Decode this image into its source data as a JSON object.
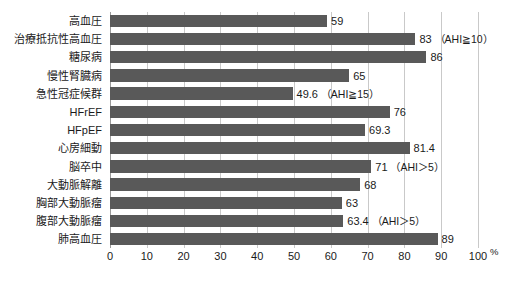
{
  "chart_data": {
    "type": "bar",
    "orientation": "horizontal",
    "title": "",
    "xlabel": "%",
    "ylabel": "",
    "xlim": [
      0,
      100
    ],
    "xticks": [
      0,
      10,
      20,
      30,
      40,
      50,
      60,
      70,
      80,
      90,
      100
    ],
    "grid": true,
    "legend": "none",
    "bar_color": "#595959",
    "categories": [
      "高血圧",
      "治療抵抗性高血圧",
      "糖尿病",
      "慢性腎臓病",
      "急性冠症候群",
      "HFrEF",
      "HFpEF",
      "心房細動",
      "脳卒中",
      "大動脈解離",
      "胸部大動脈瘤",
      "腹部大動脈瘤",
      "肺高血圧"
    ],
    "values": [
      59,
      83,
      86,
      65,
      49.6,
      76,
      69.3,
      81.4,
      71,
      68,
      63,
      63.4,
      89
    ],
    "value_labels": [
      "59",
      "83",
      "86",
      "65",
      "49.6",
      "76",
      "69.3",
      "81.4",
      "71",
      "68",
      "63",
      "63.4",
      "89"
    ],
    "annotations": [
      "",
      "（AHI≧10）",
      "",
      "",
      "（AHI≧15）",
      "",
      "",
      "",
      "（AHI＞5）",
      "",
      "",
      "（AHI＞5）",
      ""
    ]
  }
}
